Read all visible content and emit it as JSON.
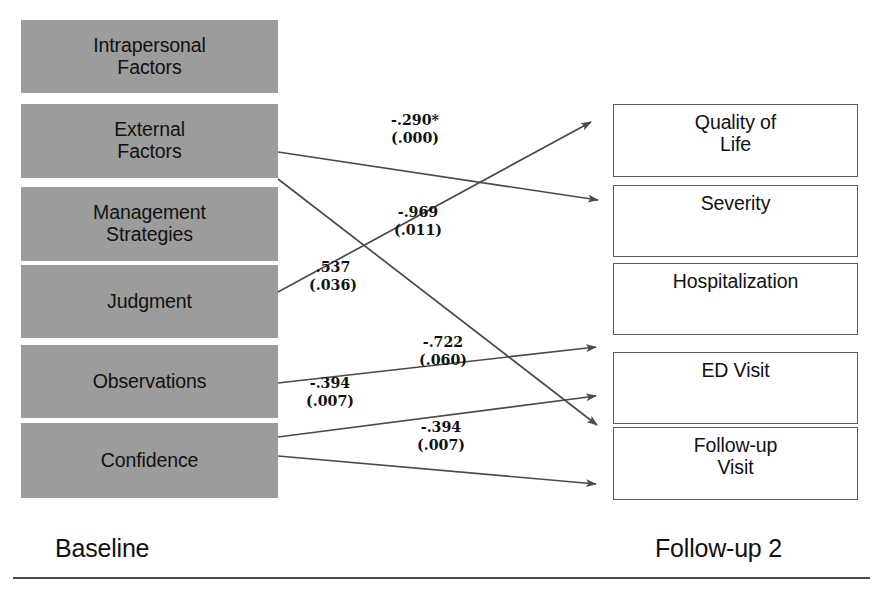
{
  "diagram": {
    "colors": {
      "left_box_fill": "#9c9c9c",
      "right_box_border": "#5b5b5b",
      "arrow_stroke": "#4a4a4a",
      "text": "#111111"
    },
    "left_column": {
      "caption": "Baseline",
      "boxes": [
        {
          "id": "intrapersonal-factors",
          "line1": "Intrapersonal",
          "line2": "Factors"
        },
        {
          "id": "external-factors",
          "line1": "External",
          "line2": "Factors"
        },
        {
          "id": "management-strategies",
          "line1": "Management",
          "line2": "Strategies"
        },
        {
          "id": "judgment",
          "line1": "Judgment",
          "line2": ""
        },
        {
          "id": "observations",
          "line1": "Observations",
          "line2": ""
        },
        {
          "id": "confidence",
          "line1": "Confidence",
          "line2": ""
        }
      ]
    },
    "right_column": {
      "caption": "Follow-up 2",
      "boxes": [
        {
          "id": "quality-of-life",
          "line1": "Quality of",
          "line2": "Life"
        },
        {
          "id": "severity",
          "line1": "Severity",
          "line2": ""
        },
        {
          "id": "hospitalization",
          "line1": "Hospitalization",
          "line2": ""
        },
        {
          "id": "ed-visit",
          "line1": "ED Visit",
          "line2": ""
        },
        {
          "id": "follow-up-visit",
          "line1": "Follow-up",
          "line2": "Visit"
        }
      ]
    },
    "paths": [
      {
        "id": "external-factors-to-severity",
        "coefficient": "-.290*",
        "p_value": "(.000)",
        "from": "external-factors",
        "to": "severity"
      },
      {
        "id": "external-factors-to-follow-up-visit",
        "coefficient": "-.969",
        "p_value": "(.011)",
        "from": "external-factors",
        "to": "follow-up-visit"
      },
      {
        "id": "judgment-to-quality-of-life",
        "coefficient": ".537",
        "p_value": "(.036)",
        "from": "judgment",
        "to": "quality-of-life"
      },
      {
        "id": "observations-to-ed-visit",
        "coefficient": "-.722",
        "p_value": "(.060)",
        "from": "observations",
        "to": "ed-visit"
      },
      {
        "id": "confidence-to-ed-visit",
        "coefficient": "-.394",
        "p_value": "(.007)",
        "from": "confidence",
        "to": "ed-visit"
      },
      {
        "id": "confidence-to-follow-up-visit",
        "coefficient": "",
        "p_value": "",
        "from": "confidence",
        "to": "follow-up-visit"
      }
    ],
    "footnote_marker": "*"
  }
}
